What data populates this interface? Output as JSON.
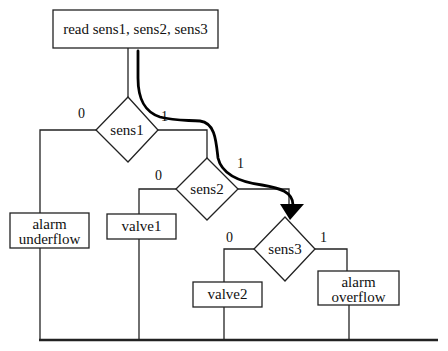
{
  "diagram": {
    "type": "flowchart",
    "start": {
      "label": "read  sens1, sens2, sens3"
    },
    "decisions": [
      {
        "id": "sens1",
        "label": "sens1",
        "false_label": "0",
        "true_label": "1"
      },
      {
        "id": "sens2",
        "label": "sens2",
        "false_label": "0",
        "true_label": "1"
      },
      {
        "id": "sens3",
        "label": "sens3",
        "false_label": "0",
        "true_label": "1"
      }
    ],
    "actions": [
      {
        "id": "alarm_underflow",
        "line1": "alarm",
        "line2": "underflow"
      },
      {
        "id": "valve1",
        "line1": "valve1"
      },
      {
        "id": "valve2",
        "line1": "valve2"
      },
      {
        "id": "alarm_overflow",
        "line1": "alarm",
        "line2": "overflow"
      }
    ],
    "highlighted_path": [
      "read",
      "sens1=1",
      "sens2=1",
      "sens3"
    ],
    "colors": {
      "stroke": "#222222",
      "background": "#ffffff",
      "path": "#000000"
    }
  }
}
